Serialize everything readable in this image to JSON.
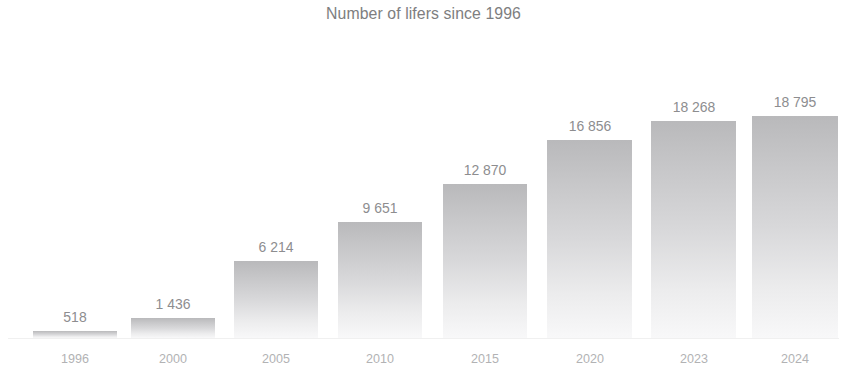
{
  "chart_data": {
    "type": "bar",
    "title": "Number of lifers since 1996",
    "xlabel": "",
    "ylabel": "",
    "categories": [
      "1996",
      "2000",
      "2005",
      "2010",
      "2015",
      "2020",
      "2023",
      "2024"
    ],
    "values": [
      518,
      1436,
      6214,
      9651,
      12870,
      16856,
      18268,
      18795
    ],
    "value_labels": [
      "518",
      "1 436",
      "6 214",
      "9 651",
      "12 870",
      "16 856",
      "18 268",
      "18 795"
    ],
    "ylim": [
      0,
      18795
    ],
    "grid": false,
    "legend": null,
    "bar_style": {
      "fill_top_color": "#b9b9bb",
      "fill_bottom_color": "#f8f8f9",
      "gradient": "vertical-top-dark-to-bottom-light"
    },
    "title_color": "#7e7e80",
    "value_label_color": "#8d8d8f",
    "category_label_color": "#b2b2b4",
    "axis_line_color": "#f0f0f0",
    "background_color": "#ffffff"
  },
  "bars": [
    {
      "category": "1996",
      "value_label": "518",
      "left": 33,
      "width": 84,
      "height": 7
    },
    {
      "category": "2000",
      "value_label": "1 436",
      "left": 131,
      "width": 84,
      "height": 20
    },
    {
      "category": "2005",
      "value_label": "6 214",
      "left": 234,
      "width": 84,
      "height": 77
    },
    {
      "category": "2010",
      "value_label": "9 651",
      "left": 338,
      "width": 84,
      "height": 116
    },
    {
      "category": "2015",
      "value_label": "12 870",
      "left": 443,
      "width": 84,
      "height": 154
    },
    {
      "category": "2020",
      "value_label": "16 856",
      "left": 547,
      "width": 85,
      "height": 198
    },
    {
      "category": "2023",
      "value_label": "18 268",
      "left": 651,
      "width": 85,
      "height": 217
    },
    {
      "category": "2024",
      "value_label": "18 795",
      "left": 752,
      "width": 86,
      "height": 222
    }
  ]
}
